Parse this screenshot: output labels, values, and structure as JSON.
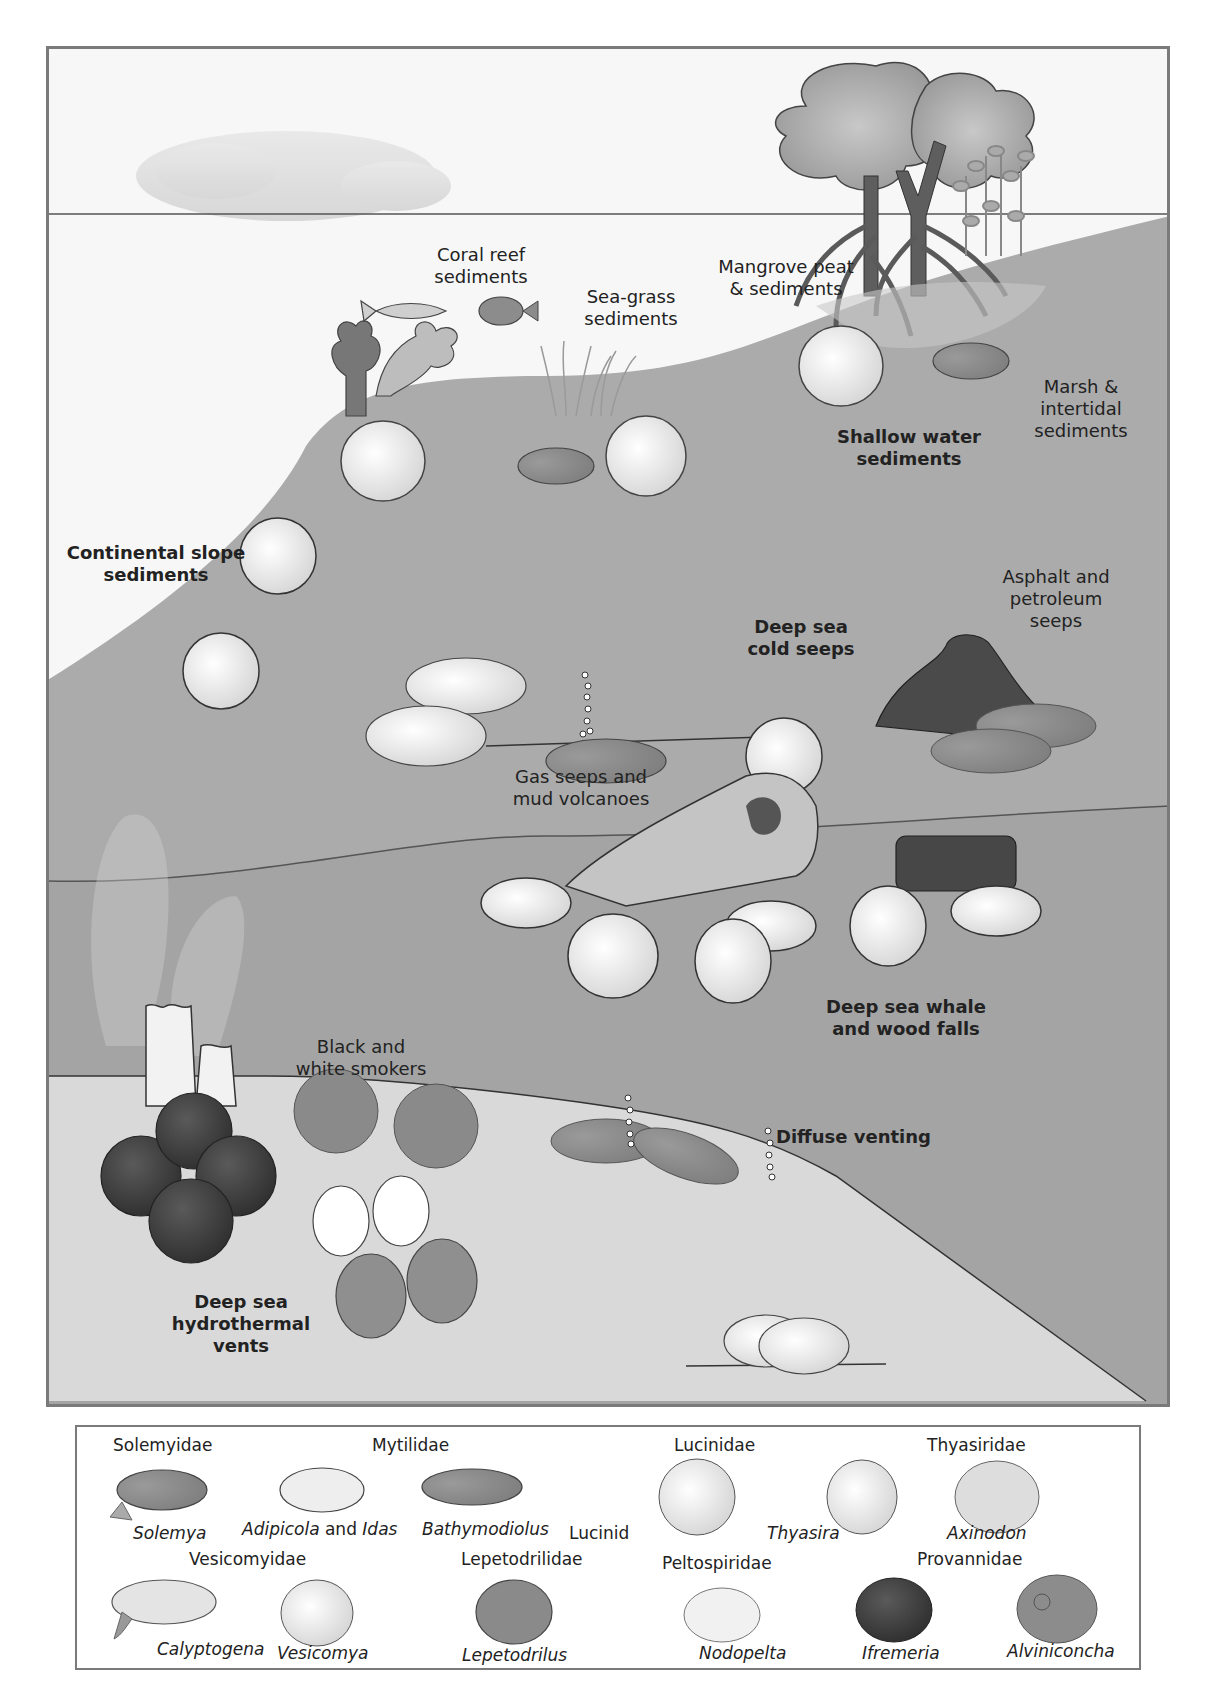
{
  "scene": {
    "colors": {
      "frame": "#7a7a7a",
      "sky": "#f7f7f7",
      "shallow_sediment": "#b9b9b9",
      "slope_water": "#a9a9a9",
      "deep_water": "#a3a3a3",
      "vent_floor": "#d9d9d9",
      "dark_mussel": "#8a8a8a",
      "light_shell": "#ececec",
      "snail_dark": "#3f3f3f"
    },
    "labels": {
      "coral_reef": "Coral reef\nsediments",
      "sea_grass": "Sea-grass\nsediments",
      "mangrove": "Mangrove peat\n& sediments",
      "marsh": "Marsh &\nintertidal\nsediments",
      "shallow_water": "Shallow water\nsediments",
      "continental_slope": "Continental slope\nsediments",
      "cold_seeps": "Deep sea\ncold seeps",
      "asphalt": "Asphalt and\npetroleum\nseeps",
      "gas_seeps": "Gas seeps and\nmud volcanoes",
      "whale_wood": "Deep sea whale\nand wood falls",
      "smokers": "Black and\nwhite smokers",
      "diffuse": "Diffuse venting",
      "hydrothermal": "Deep sea\nhydrothermal\nvents"
    }
  },
  "legend": {
    "families": {
      "solemyidae": "Solemyidae",
      "mytilidae": "Mytilidae",
      "lucinidae": "Lucinidae",
      "thyasiridae": "Thyasiridae",
      "vesicomyidae": "Vesicomyidae",
      "lepetodrilidae": "Lepetodrilidae",
      "peltospiridae": "Peltospiridae",
      "provannidae": "Provannidae"
    },
    "genera": {
      "solemya": "Solemya",
      "adipicola": "Adipicola",
      "and": " and ",
      "idas": "Idas",
      "bathymodiolus": "Bathymodiolus",
      "lucinid": "Lucinid",
      "thyasira": "Thyasira",
      "axinodon": "Axinodon",
      "calyptogena": "Calyptogena",
      "vesicomya": "Vesicomya",
      "lepetodrilus": "Lepetodrilus",
      "nodopelta": "Nodopelta",
      "ifremeria": "Ifremeria",
      "alviniconcha": "Alviniconcha"
    }
  }
}
